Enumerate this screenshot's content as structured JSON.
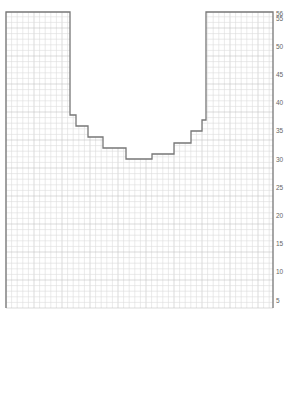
{
  "diagram": {
    "type": "knitting-chart",
    "colors": {
      "grid_minor": "#dcdcdc",
      "grid_major": "#c4c4c4",
      "outline": "#777777",
      "background": "#ffffff",
      "label": "#666666"
    },
    "grid": {
      "left": 6,
      "right": 273,
      "top": 12,
      "bottom": 308,
      "cell": 5.6
    },
    "row_labels": [
      {
        "text": "56",
        "y": 16
      },
      {
        "text": "55",
        "y": 21
      },
      {
        "text": "50",
        "y": 49
      },
      {
        "text": "45",
        "y": 77
      },
      {
        "text": "40",
        "y": 105
      },
      {
        "text": "35",
        "y": 133
      },
      {
        "text": "30",
        "y": 162
      },
      {
        "text": "25",
        "y": 190
      },
      {
        "text": "20",
        "y": 218
      },
      {
        "text": "15",
        "y": 246
      },
      {
        "text": "10",
        "y": 274
      },
      {
        "text": "5",
        "y": 303
      }
    ],
    "outline_points": [
      [
        6,
        308
      ],
      [
        6,
        12
      ],
      [
        70,
        12
      ],
      [
        70,
        115
      ],
      [
        76,
        115
      ],
      [
        76,
        126
      ],
      [
        88,
        126
      ],
      [
        88,
        137
      ],
      [
        103,
        137
      ],
      [
        103,
        148
      ],
      [
        126,
        148
      ],
      [
        126,
        159
      ],
      [
        152,
        159
      ],
      [
        152,
        154
      ],
      [
        174,
        154
      ],
      [
        174,
        143
      ],
      [
        191,
        143
      ],
      [
        191,
        131
      ],
      [
        202,
        131
      ],
      [
        202,
        120
      ],
      [
        206,
        120
      ],
      [
        206,
        12
      ],
      [
        273,
        12
      ],
      [
        273,
        308
      ]
    ]
  }
}
